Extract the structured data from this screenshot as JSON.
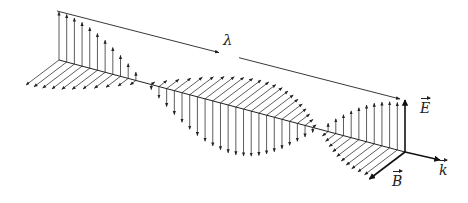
{
  "figure": {
    "labels": {
      "wavelength": "λ",
      "electric_field": "E",
      "magnetic_field": "B",
      "wave_vector": "k"
    },
    "colors": {
      "stroke": "#222222",
      "background": "#ffffff"
    },
    "geometry": {
      "axis_start": [
        59,
        60
      ],
      "axis_end": [
        405,
        152
      ],
      "k_tip": [
        440,
        160
      ],
      "e_amplitude_px": 48,
      "b_vector_px": [
        -33,
        25
      ],
      "vector_count": 46,
      "wavelength_arrow": {
        "from": [
          57,
          11
        ],
        "to": [
          400,
          99
        ]
      },
      "lambda_label_pos": [
        227,
        41
      ]
    }
  }
}
